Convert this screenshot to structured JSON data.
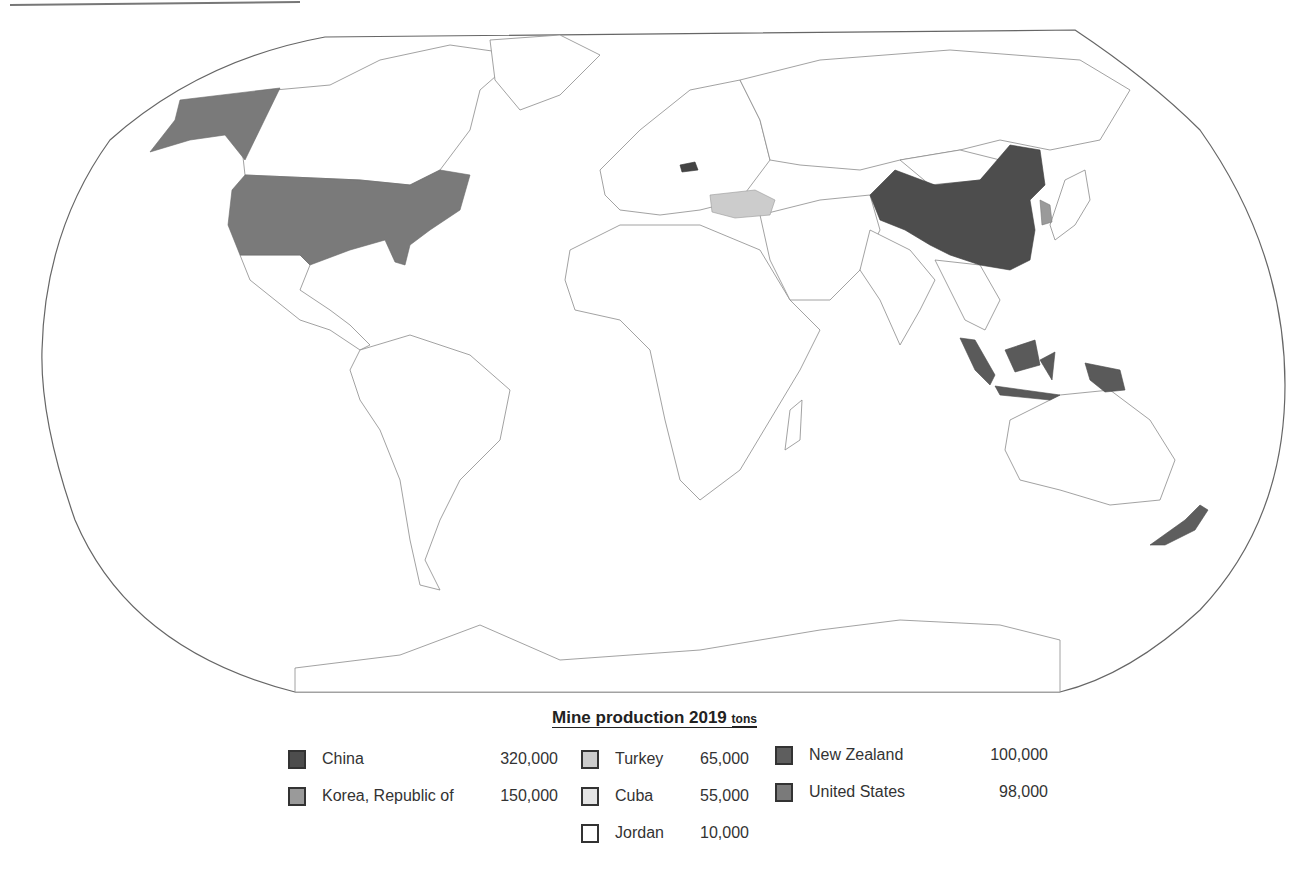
{
  "legend": {
    "title": "Mine production 2019",
    "unit": "tons",
    "entries": [
      {
        "name": "China",
        "value": "320,000",
        "color": "#4d4d4d"
      },
      {
        "name": "Korea, Republic of",
        "value": "150,000",
        "color": "#9a9a9a"
      },
      {
        "name": "Turkey",
        "value": "65,000",
        "color": "#cccccc"
      },
      {
        "name": "Cuba",
        "value": "55,000",
        "color": "#e4e4e4"
      },
      {
        "name": "Jordan",
        "value": "10,000",
        "color": "#ffffff"
      },
      {
        "name": "New Zealand",
        "value": "100,000",
        "color": "#5e5e5e"
      },
      {
        "name": "United States",
        "value": "98,000",
        "color": "#7a7a7a"
      }
    ]
  },
  "map": {
    "projection": "Robinson-like world outline",
    "colors": {
      "land_default": "#ffffff",
      "border": "#8a8a8a",
      "outline": "#666666",
      "china": "#4d4d4d",
      "united_states": "#7a7a7a",
      "korea": "#9a9a9a",
      "turkey": "#cccccc",
      "indonesia": "#5a5a5a",
      "new_zealand": "#5e5e5e",
      "slovakia": "#444444"
    }
  }
}
